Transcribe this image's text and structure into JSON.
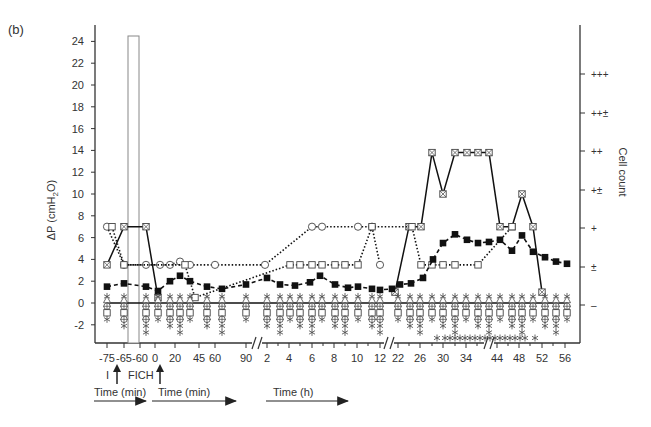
{
  "panel_label": "(b)",
  "chart_data": {
    "type": "line",
    "title": "",
    "panel": "(b)",
    "ylabel": "ΔP (cmH2O)",
    "ylabel_parts": {
      "pre": "ΔP (cmH",
      "sub": "2",
      "post": "O)"
    },
    "y2label": "Cell count",
    "ylim": [
      -3.5,
      25
    ],
    "yticks": [
      -2,
      0,
      2,
      4,
      6,
      8,
      10,
      12,
      14,
      16,
      18,
      20,
      22,
      24
    ],
    "y2ticks": [
      "+++",
      "++±",
      "++",
      "+±",
      "+",
      "±",
      "–"
    ],
    "xtick_labels": [
      "-75",
      "-65",
      "-60",
      "0",
      "20",
      "45",
      "60",
      "90",
      "2",
      "4",
      "6",
      "8",
      "10",
      "12",
      "22",
      "26",
      "30",
      "34",
      "44",
      "48",
      "52",
      "56"
    ],
    "xtick_px": [
      107,
      124,
      140,
      155,
      175,
      199,
      215,
      246,
      267,
      289,
      312,
      334,
      357,
      380,
      398,
      420,
      443,
      466,
      497,
      519,
      542,
      565
    ],
    "axis_breaks_px": [
      257,
      389,
      489
    ],
    "annotations": {
      "I": "I",
      "FICH": "FICH",
      "time_min_1": "Time (min)",
      "time_min_2": "Time (min)",
      "time_h": "Time (h)"
    },
    "grid": false,
    "legend": "none",
    "series": [
      {
        "name": "solid-crossed-square",
        "style": "solid",
        "marker": "crossed-square",
        "points": [
          [
            107,
            3.5
          ],
          [
            124,
            7
          ],
          [
            146,
            7
          ],
          [
            158,
            0.5
          ]
        ]
      },
      {
        "name": "solid-crossed-square-late",
        "style": "solid",
        "marker": "crossed-square",
        "points": [
          [
            395,
            1
          ],
          [
            409,
            7
          ],
          [
            421,
            7
          ],
          [
            432,
            13.8
          ],
          [
            443,
            10
          ],
          [
            455,
            13.8
          ],
          [
            467,
            13.8
          ],
          [
            478,
            13.8
          ],
          [
            489,
            13.8
          ],
          [
            500,
            7
          ],
          [
            512,
            7
          ],
          [
            522,
            10
          ],
          [
            533,
            7
          ],
          [
            542,
            1
          ]
        ]
      },
      {
        "name": "dotted-circle",
        "style": "dotted",
        "marker": "circle",
        "points": [
          [
            107,
            7
          ],
          [
            124,
            3.5
          ],
          [
            146,
            3.5
          ],
          [
            160,
            3.5
          ],
          [
            170,
            3.5
          ],
          [
            180,
            3.8
          ],
          [
            190,
            3.5
          ],
          [
            215,
            3.5
          ],
          [
            265,
            3.5
          ],
          [
            312,
            7
          ],
          [
            322,
            7
          ],
          [
            358,
            7
          ],
          [
            372,
            7
          ],
          [
            380,
            3.5
          ]
        ]
      },
      {
        "name": "dotted-square",
        "style": "dotted",
        "marker": "square",
        "points": [
          [
            112,
            7
          ],
          [
            124,
            3.5
          ],
          [
            185,
            3.5
          ],
          [
            195,
            0.5
          ],
          [
            290,
            3.5
          ],
          [
            300,
            3.5
          ],
          [
            312,
            3.5
          ],
          [
            322,
            3.5
          ],
          [
            335,
            3.5
          ],
          [
            345,
            3.5
          ],
          [
            358,
            3.5
          ],
          [
            372,
            7
          ],
          [
            412,
            7
          ],
          [
            421,
            3.5
          ],
          [
            432,
            3.5
          ],
          [
            443,
            3.5
          ],
          [
            455,
            3.5
          ],
          [
            478,
            3.5
          ],
          [
            512,
            7
          ]
        ]
      },
      {
        "name": "dashed-filled-square",
        "style": "dashed",
        "marker": "filled-square",
        "points": [
          [
            107,
            1.5
          ],
          [
            124,
            1.8
          ],
          [
            146,
            1.5
          ],
          [
            158,
            1.1
          ],
          [
            170,
            2
          ],
          [
            180,
            2.5
          ],
          [
            190,
            2
          ],
          [
            207,
            1.5
          ],
          [
            222,
            1.3
          ],
          [
            246,
            1.7
          ],
          [
            267,
            2.3
          ],
          [
            280,
            1.7
          ],
          [
            295,
            1.6
          ],
          [
            310,
            1.9
          ],
          [
            320,
            2.5
          ],
          [
            335,
            1.7
          ],
          [
            348,
            1.4
          ],
          [
            358,
            1.5
          ],
          [
            372,
            1.3
          ],
          [
            380,
            1.2
          ],
          [
            392,
            1.3
          ],
          [
            400,
            1.7
          ],
          [
            411,
            1.8
          ],
          [
            423,
            2.3
          ],
          [
            433,
            4
          ],
          [
            443,
            5.5
          ],
          [
            455,
            6.3
          ],
          [
            467,
            5.8
          ],
          [
            478,
            5.5
          ],
          [
            489,
            5.6
          ],
          [
            500,
            5.8
          ],
          [
            512,
            4.8
          ],
          [
            522,
            6.2
          ],
          [
            533,
            4.7
          ],
          [
            545,
            4.2
          ],
          [
            556,
            3.8
          ],
          [
            567,
            3.6
          ]
        ]
      },
      {
        "name": "solid-baseline-zero",
        "style": "solid",
        "marker": "mixed",
        "points": [
          [
            107,
            0
          ],
          [
            567,
            0
          ]
        ]
      }
    ],
    "baseline_marker_x_px": [
      107,
      124,
      146,
      158,
      170,
      180,
      190,
      207,
      222,
      246,
      267,
      280,
      290,
      300,
      312,
      322,
      335,
      345,
      358,
      372,
      380,
      398,
      410,
      420,
      432,
      443,
      455,
      466,
      478,
      489,
      500,
      512,
      522,
      533,
      545,
      556,
      567
    ],
    "bottom_asterisks_x_px": [
      437,
      445,
      450,
      455,
      460,
      465,
      470,
      475,
      480,
      485,
      490,
      495,
      500,
      505,
      510,
      515,
      520,
      525,
      535
    ],
    "rectangle_annotation": {
      "x_px": [
        128,
        139
      ],
      "y_top": 24.5,
      "y_bottom": -3.5
    }
  }
}
